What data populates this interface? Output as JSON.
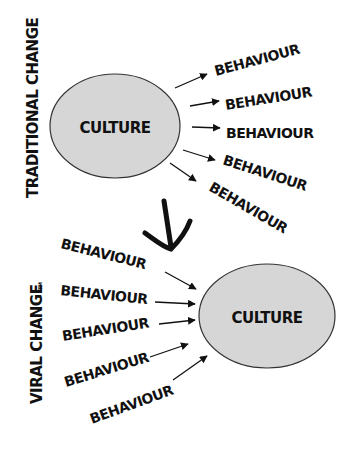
{
  "diagram": {
    "sections": [
      {
        "id": "traditional",
        "side_label": "TRADITIONAL CHANGE",
        "center": "CULTURE",
        "direction": "outward",
        "behaviours": [
          "BEHAVIOUR",
          "BEHAVIOUR",
          "BEHAVIOUR",
          "BEHAVIOUR",
          "BEHAVIOUR"
        ]
      },
      {
        "id": "viral",
        "side_label": "VIRAL CHANGE",
        "trademark": "TM",
        "center": "CULTURE",
        "direction": "inward",
        "behaviours": [
          "BEHAVIOUR",
          "BEHAVIOUR",
          "BEHAVIOUR",
          "BEHAVIOUR",
          "BEHAVIOUR"
        ]
      }
    ],
    "transition_arrow": "down-arrow",
    "colors": {
      "ellipse_fill": "#d6d6d6",
      "stroke": "#111111",
      "background": "#ffffff"
    }
  }
}
